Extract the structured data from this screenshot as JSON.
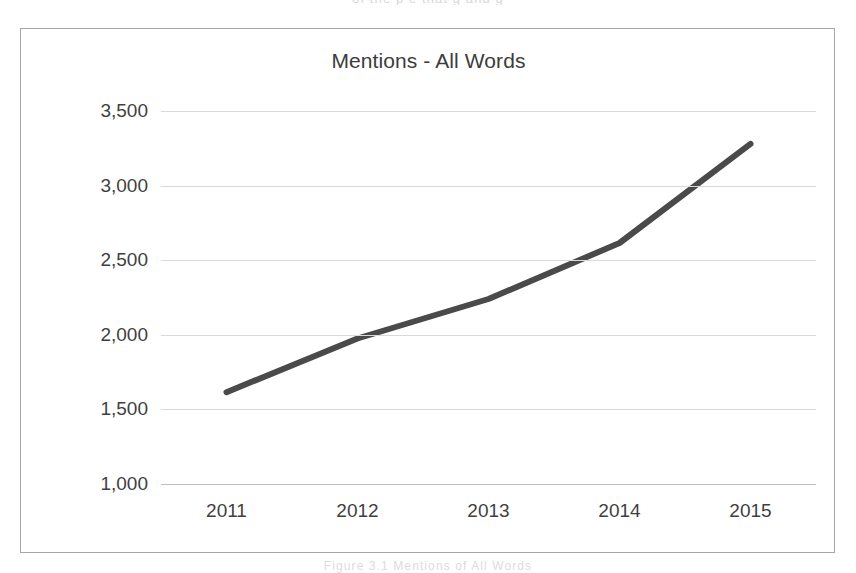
{
  "page": {
    "background_color": "#ffffff",
    "artifact_text_top": "of the  p    e    that  g       and       g",
    "artifact_text_bottom": "Figure 3.1  Mentions  of  All Words"
  },
  "frame": {
    "border_color": "#a6a6a6"
  },
  "chart_data": {
    "type": "line",
    "title": "Mentions - All Words",
    "xlabel": "",
    "ylabel": "",
    "categories": [
      "2011",
      "2012",
      "2013",
      "2014",
      "2015"
    ],
    "x": [
      2011,
      2012,
      2013,
      2014,
      2015
    ],
    "values": [
      1615,
      1975,
      2240,
      2615,
      3280
    ],
    "series": [
      {
        "name": "Mentions - All Words",
        "values": [
          1615,
          1975,
          2240,
          2615,
          3280
        ],
        "color": "#4a4a4a",
        "line_width": 6,
        "markers": false
      }
    ],
    "ylim": [
      1000,
      3500
    ],
    "ytick_values": [
      3500,
      3000,
      2500,
      2000,
      1500,
      1000
    ],
    "ytick_labels": [
      "3,500",
      "3,000",
      "2,500",
      "2,000",
      "1,500",
      "1,000"
    ],
    "xtick_labels": [
      "2011",
      "2012",
      "2013",
      "2014",
      "2015"
    ],
    "grid": true,
    "grid_axis": "y",
    "grid_color": "#d9d9d9",
    "legend": false,
    "legend_position": "none",
    "annotations": []
  }
}
